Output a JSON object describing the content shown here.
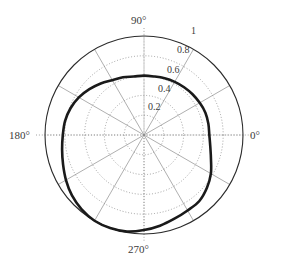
{
  "figure": {
    "type": "polar-plot",
    "width": 282,
    "height": 269,
    "background": "#ffffff"
  },
  "axes": {
    "center_x": 144,
    "center_y": 135,
    "outer_radius": 99,
    "outline_color": "#2b2b2b",
    "grid_color": "#8c8c8c",
    "curve_color": "#1a1a1a",
    "angle_labels": [
      {
        "text": "0°",
        "angle": 0,
        "x": 250,
        "y": 129
      },
      {
        "text": "90°",
        "angle": 90,
        "x": 131,
        "y": 14
      },
      {
        "text": "180°",
        "angle": 180,
        "x": 9,
        "y": 129
      },
      {
        "text": "270°",
        "angle": 270,
        "x": 128,
        "y": 243
      }
    ],
    "radial_labels": [
      {
        "text": "0.2",
        "value": 0.2,
        "x": 148,
        "y": 101
      },
      {
        "text": "0.4",
        "value": 0.4,
        "x": 158,
        "y": 83
      },
      {
        "text": "0.6",
        "value": 0.6,
        "x": 167,
        "y": 64
      },
      {
        "text": "0.8",
        "value": 0.8,
        "x": 177,
        "y": 44
      },
      {
        "text": "1",
        "value": 1.0,
        "x": 191,
        "y": 25
      }
    ]
  },
  "chart_data": {
    "type": "line",
    "coordinate_system": "polar",
    "title": "",
    "xlabel": "",
    "ylabel": "",
    "rlim": [
      0,
      1
    ],
    "rticks": [
      0.2,
      0.4,
      0.6,
      0.8,
      1.0
    ],
    "rtick_labels": [
      "0.2",
      "0.4",
      "0.6",
      "0.8",
      "1"
    ],
    "theta_ticks_deg": [
      0,
      30,
      60,
      90,
      120,
      150,
      180,
      210,
      240,
      270,
      300,
      330
    ],
    "theta_tick_labels": [
      "0°",
      "",
      "",
      "90°",
      "",
      "",
      "180°",
      "",
      "",
      "270°",
      "",
      ""
    ],
    "grid": true,
    "grid_style": "dotted",
    "legend": false,
    "series": [
      {
        "name": "radiation-pattern",
        "color": "#1a1a1a",
        "linewidth": 2.6,
        "closed": true,
        "theta_deg": [
          0,
          10,
          20,
          30,
          40,
          50,
          60,
          70,
          80,
          90,
          100,
          110,
          120,
          130,
          140,
          150,
          160,
          170,
          180,
          190,
          200,
          210,
          220,
          230,
          240,
          250,
          260,
          270,
          280,
          290,
          300,
          310,
          320,
          330,
          340,
          350
        ],
        "r": [
          0.66,
          0.66,
          0.66,
          0.65,
          0.64,
          0.63,
          0.62,
          0.61,
          0.6,
          0.6,
          0.6,
          0.62,
          0.64,
          0.68,
          0.72,
          0.76,
          0.79,
          0.81,
          0.82,
          0.84,
          0.87,
          0.91,
          0.95,
          0.98,
          1.0,
          1.0,
          0.99,
          0.96,
          0.93,
          0.9,
          0.88,
          0.87,
          0.83,
          0.78,
          0.72,
          0.68
        ]
      }
    ]
  }
}
